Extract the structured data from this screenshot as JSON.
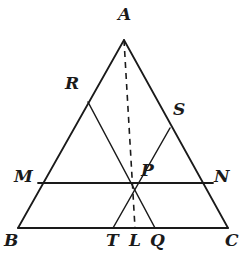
{
  "figure": {
    "kind": "euclidean-geometry-diagram",
    "background_color": "#ffffff",
    "stroke_color": "#1a1a1a",
    "label_color": "#1a1a1a",
    "canvas": {
      "width": 242,
      "height": 258
    }
  },
  "points": {
    "A": {
      "label": "A",
      "x": 124,
      "y": 40,
      "label_x": 118,
      "label_y": 6,
      "role": "apex-vertex"
    },
    "B": {
      "label": "B",
      "x": 18,
      "y": 228,
      "label_x": 4,
      "label_y": 232,
      "role": "base-left-vertex"
    },
    "C": {
      "label": "C",
      "x": 228,
      "y": 228,
      "label_x": 225,
      "label_y": 232,
      "role": "base-right-vertex"
    },
    "M": {
      "label": "M",
      "x": 38,
      "y": 183,
      "label_x": 14,
      "label_y": 168,
      "role": "point-on-AB"
    },
    "N": {
      "label": "N",
      "x": 213,
      "y": 183,
      "label_x": 214,
      "label_y": 168,
      "role": "point-on-AC"
    },
    "R": {
      "label": "R",
      "x": 88,
      "y": 102,
      "label_x": 65,
      "label_y": 75,
      "role": "point-on-AB"
    },
    "S": {
      "label": "S",
      "x": 170,
      "y": 128,
      "label_x": 173,
      "label_y": 101,
      "role": "point-on-AC"
    },
    "P": {
      "label": "P",
      "x": 133,
      "y": 183,
      "label_x": 141,
      "label_y": 162,
      "role": "concurrency-point"
    },
    "T": {
      "label": "T",
      "x": 113,
      "y": 228,
      "label_x": 106,
      "label_y": 232,
      "role": "point-on-BC"
    },
    "L": {
      "label": "L",
      "x": 135,
      "y": 228,
      "label_x": 129,
      "label_y": 232,
      "role": "point-on-BC"
    },
    "Q": {
      "label": "Q",
      "x": 155,
      "y": 228,
      "label_x": 150,
      "label_y": 232,
      "role": "point-on-BC"
    }
  },
  "segments": [
    {
      "name": "side-AB",
      "from": "A",
      "to": "B",
      "style": "solid",
      "width": 1.8
    },
    {
      "name": "side-AC",
      "from": "A",
      "to": "C",
      "style": "solid",
      "width": 1.8
    },
    {
      "name": "side-BC",
      "from": "B",
      "to": "C",
      "style": "solid",
      "width": 1.8
    },
    {
      "name": "segment-MN",
      "from": "M",
      "to": "N",
      "style": "solid",
      "width": 1.8
    },
    {
      "name": "cevian-RQ",
      "from": "R",
      "to": "Q",
      "style": "solid",
      "width": 1.5
    },
    {
      "name": "cevian-ST",
      "from": "S",
      "to": "T",
      "style": "solid",
      "width": 1.5
    },
    {
      "name": "cevian-AL",
      "from": "A",
      "to": "L",
      "style": "dashed",
      "width": 1.6,
      "dash_pattern": "6,5"
    }
  ],
  "labels_order": [
    "A",
    "R",
    "S",
    "M",
    "P",
    "N",
    "B",
    "T",
    "L",
    "Q",
    "C"
  ]
}
